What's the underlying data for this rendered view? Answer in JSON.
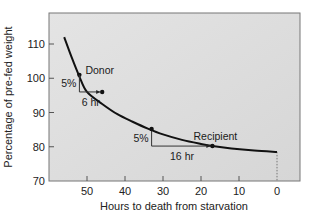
{
  "chart_data": {
    "type": "line",
    "title": "",
    "xlabel": "Hours to death from starvation",
    "ylabel": "Percentage of pre-fed weight",
    "xlim": [
      57,
      -6
    ],
    "ylim": [
      70,
      118
    ],
    "x_reversed": true,
    "x_ticks": [
      50,
      40,
      30,
      20,
      10,
      0
    ],
    "y_ticks": [
      70,
      80,
      90,
      100,
      110
    ],
    "grid": false,
    "legend": null,
    "series": [
      {
        "name": "Weight curve",
        "points": [
          {
            "x": 56,
            "y": 112
          },
          {
            "x": 54,
            "y": 106
          },
          {
            "x": 52,
            "y": 100.5
          },
          {
            "x": 50,
            "y": 96
          },
          {
            "x": 46,
            "y": 92.5
          },
          {
            "x": 42,
            "y": 89.5
          },
          {
            "x": 38,
            "y": 87.3
          },
          {
            "x": 34,
            "y": 85.3
          },
          {
            "x": 30,
            "y": 83.6
          },
          {
            "x": 25,
            "y": 82
          },
          {
            "x": 20,
            "y": 80.8
          },
          {
            "x": 17,
            "y": 80.2
          },
          {
            "x": 12,
            "y": 79.5
          },
          {
            "x": 6,
            "y": 78.9
          },
          {
            "x": 0,
            "y": 78.5
          }
        ]
      }
    ],
    "annotations": [
      {
        "label": "Donor",
        "x": 52,
        "y": 101
      },
      {
        "label": "Recipient",
        "x": 17,
        "y": 80.2
      },
      {
        "label": "5%",
        "type": "vertical-step",
        "x": 52,
        "y_from": 101,
        "y_to": 96
      },
      {
        "label": "6 hr",
        "type": "horizontal-step",
        "x_from": 52,
        "x_to": 46,
        "y": 96
      },
      {
        "label": "5%",
        "type": "vertical-step",
        "x": 33,
        "y_from": 85.2,
        "y_to": 80.2
      },
      {
        "label": "16 hr",
        "type": "horizontal-step",
        "x_from": 33,
        "x_to": 17,
        "y": 80.2
      }
    ]
  }
}
